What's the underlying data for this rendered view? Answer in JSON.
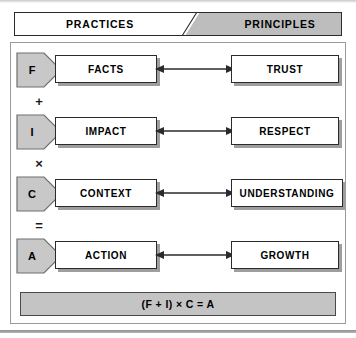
{
  "diagram": {
    "header": {
      "left_label": "PRACTICES",
      "right_label": "PRINCIPLES"
    },
    "rows": [
      {
        "letter": "F",
        "practice": "FACTS",
        "principle": "TRUST",
        "operator_below": "+"
      },
      {
        "letter": "I",
        "practice": "IMPACT",
        "principle": "RESPECT",
        "operator_below": "×"
      },
      {
        "letter": "C",
        "practice": "CONTEXT",
        "principle": "UNDERSTANDING",
        "operator_below": "="
      },
      {
        "letter": "A",
        "practice": "ACTION",
        "principle": "GROWTH",
        "operator_below": ""
      }
    ],
    "formula": "(F + I) × C = A",
    "colors": {
      "tag_fill": "#c8c8c8",
      "banner_right_fill": "#bdbdbd",
      "formula_fill": "#c4c4c4",
      "shadow": "#9e9e9e",
      "outline": "#2b2b2b"
    }
  }
}
